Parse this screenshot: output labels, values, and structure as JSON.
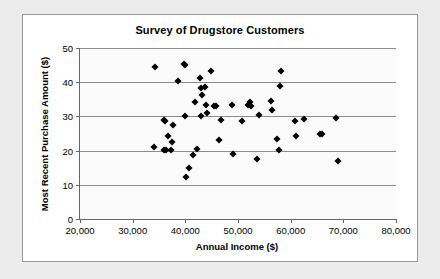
{
  "chart_data": {
    "type": "scatter",
    "title": "Survey of Drugstore Customers",
    "xlabel": "Annual Income ($)",
    "ylabel": "Most Recent Purchase Amount ($)",
    "xlim": [
      20000,
      80000
    ],
    "ylim": [
      0,
      50
    ],
    "xticks": [
      20000,
      30000,
      40000,
      50000,
      60000,
      70000,
      80000
    ],
    "xtick_labels": [
      "20,000",
      "30,000",
      "40,000",
      "50,000",
      "60,000",
      "70,000",
      "80,000"
    ],
    "yticks": [
      0,
      10,
      20,
      30,
      40,
      50
    ],
    "ytick_labels": [
      "0",
      "10",
      "20",
      "30",
      "40",
      "50"
    ],
    "grid": "horizontal",
    "legend": "none",
    "marker": "diamond",
    "marker_color": "#000000",
    "points": [
      [
        34200,
        44.3
      ],
      [
        34000,
        21.1
      ],
      [
        35900,
        29.0
      ],
      [
        36100,
        28.6
      ],
      [
        36000,
        20.1
      ],
      [
        36400,
        20.2
      ],
      [
        36700,
        24.4
      ],
      [
        37300,
        20.1
      ],
      [
        37500,
        22.5
      ],
      [
        37700,
        27.4
      ],
      [
        38700,
        40.4
      ],
      [
        39700,
        45.3
      ],
      [
        40000,
        45.0
      ],
      [
        39900,
        30.2
      ],
      [
        40200,
        12.3
      ],
      [
        40700,
        14.8
      ],
      [
        41400,
        18.8
      ],
      [
        41900,
        34.3
      ],
      [
        42200,
        20.5
      ],
      [
        42800,
        41.3
      ],
      [
        43000,
        38.2
      ],
      [
        43100,
        36.3
      ],
      [
        43000,
        30.0
      ],
      [
        43800,
        38.7
      ],
      [
        44000,
        33.2
      ],
      [
        44200,
        30.9
      ],
      [
        44800,
        43.3
      ],
      [
        45400,
        33.1
      ],
      [
        45900,
        33.0
      ],
      [
        46400,
        23.1
      ],
      [
        46700,
        28.9
      ],
      [
        48800,
        33.4
      ],
      [
        49100,
        19.0
      ],
      [
        50700,
        28.6
      ],
      [
        51900,
        33.3
      ],
      [
        52300,
        34.1
      ],
      [
        52500,
        33.0
      ],
      [
        53900,
        30.3
      ],
      [
        53700,
        17.5
      ],
      [
        56200,
        34.4
      ],
      [
        56400,
        31.8
      ],
      [
        57400,
        23.5
      ],
      [
        57800,
        20.3
      ],
      [
        57900,
        38.9
      ],
      [
        58200,
        43.4
      ],
      [
        60800,
        28.7
      ],
      [
        61100,
        24.3
      ],
      [
        62500,
        29.2
      ],
      [
        65500,
        25.0
      ],
      [
        65900,
        24.8
      ],
      [
        68600,
        29.6
      ],
      [
        68900,
        17.0
      ]
    ]
  }
}
